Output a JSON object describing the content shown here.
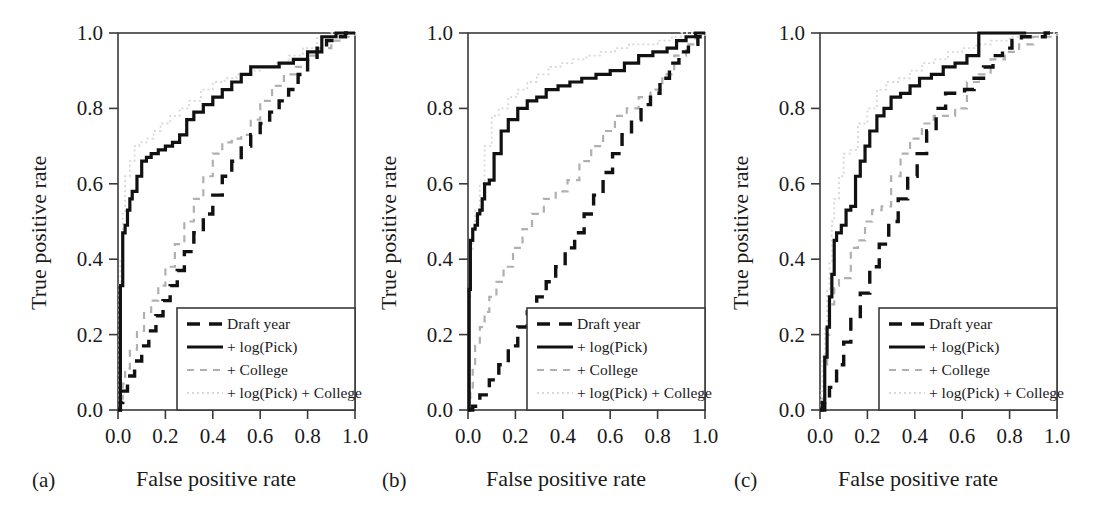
{
  "figure": {
    "background": "#ffffff",
    "panel_count": 3
  },
  "axis": {
    "xlabel": "False positive rate",
    "ylabel": "True positive rate",
    "xticks": [
      "0.0",
      "0.2",
      "0.4",
      "0.6",
      "0.8",
      "1.0"
    ],
    "yticks": [
      "0.0",
      "0.2",
      "0.4",
      "0.6",
      "0.8",
      "1.0"
    ],
    "xlim": [
      0,
      1
    ],
    "ylim": [
      0,
      1
    ]
  },
  "legend": {
    "entries": [
      {
        "label": "Draft year",
        "style": "dashed",
        "color": "#111111",
        "width": 3.4
      },
      {
        "label": "+ log(Pick)",
        "style": "solid",
        "color": "#111111",
        "width": 3.2
      },
      {
        "label": "+ College",
        "style": "dashed",
        "color": "#b0b0b0",
        "width": 2.2
      },
      {
        "label": "+ log(Pick) + College",
        "style": "dotted",
        "color": "#d8d8d8",
        "width": 1.8
      }
    ]
  },
  "panels": [
    {
      "tag": "(a)",
      "name": "panel-a"
    },
    {
      "tag": "(b)",
      "name": "panel-b"
    },
    {
      "tag": "(c)",
      "name": "panel-c"
    }
  ],
  "chart_data": {
    "type": "line",
    "title": "",
    "xlabel": "False positive rate",
    "ylabel": "True positive rate",
    "xlim": [
      0,
      1
    ],
    "ylim": [
      0,
      1
    ],
    "grid": false,
    "legend_position": "lower-right",
    "panels": [
      {
        "tag": "(a)",
        "series": [
          {
            "name": "Draft year",
            "x": [
              0.0,
              0.01,
              0.02,
              0.04,
              0.07,
              0.1,
              0.13,
              0.16,
              0.19,
              0.22,
              0.25,
              0.28,
              0.32,
              0.36,
              0.4,
              0.44,
              0.48,
              0.52,
              0.56,
              0.6,
              0.64,
              0.68,
              0.72,
              0.76,
              0.8,
              0.84,
              0.88,
              0.92,
              0.96,
              1.0
            ],
            "y": [
              0.0,
              0.02,
              0.05,
              0.09,
              0.13,
              0.17,
              0.21,
              0.25,
              0.29,
              0.33,
              0.37,
              0.42,
              0.47,
              0.52,
              0.57,
              0.62,
              0.66,
              0.7,
              0.73,
              0.76,
              0.79,
              0.82,
              0.85,
              0.89,
              0.93,
              0.96,
              0.98,
              0.99,
              1.0,
              1.0
            ]
          },
          {
            "name": "+ log(Pick)",
            "x": [
              0.0,
              0.01,
              0.02,
              0.03,
              0.04,
              0.05,
              0.06,
              0.08,
              0.1,
              0.12,
              0.14,
              0.17,
              0.2,
              0.23,
              0.26,
              0.29,
              0.32,
              0.36,
              0.4,
              0.44,
              0.48,
              0.52,
              0.56,
              0.62,
              0.68,
              0.74,
              0.8,
              0.86,
              0.92,
              1.0
            ],
            "y": [
              0.0,
              0.33,
              0.47,
              0.49,
              0.53,
              0.56,
              0.58,
              0.62,
              0.66,
              0.67,
              0.68,
              0.69,
              0.7,
              0.71,
              0.73,
              0.77,
              0.79,
              0.81,
              0.83,
              0.85,
              0.87,
              0.89,
              0.91,
              0.91,
              0.92,
              0.93,
              0.95,
              0.99,
              1.0,
              1.0
            ]
          },
          {
            "name": "+ College",
            "x": [
              0.0,
              0.01,
              0.02,
              0.03,
              0.05,
              0.08,
              0.11,
              0.14,
              0.17,
              0.2,
              0.24,
              0.28,
              0.32,
              0.36,
              0.4,
              0.44,
              0.48,
              0.52,
              0.56,
              0.6,
              0.65,
              0.7,
              0.75,
              0.8,
              0.85,
              0.9,
              0.95,
              1.0
            ],
            "y": [
              0.0,
              0.03,
              0.07,
              0.11,
              0.16,
              0.21,
              0.26,
              0.29,
              0.33,
              0.38,
              0.44,
              0.5,
              0.56,
              0.62,
              0.68,
              0.71,
              0.72,
              0.73,
              0.77,
              0.82,
              0.86,
              0.89,
              0.91,
              0.94,
              0.96,
              0.98,
              0.99,
              1.0
            ]
          },
          {
            "name": "+ log(Pick) + College",
            "x": [
              0.0,
              0.005,
              0.01,
              0.02,
              0.03,
              0.05,
              0.07,
              0.09,
              0.12,
              0.15,
              0.18,
              0.22,
              0.26,
              0.3,
              0.35,
              0.4,
              0.45,
              0.5,
              0.55,
              0.6,
              0.66,
              0.72,
              0.78,
              0.84,
              0.9,
              0.96,
              1.0
            ],
            "y": [
              0.0,
              0.34,
              0.4,
              0.52,
              0.62,
              0.66,
              0.7,
              0.71,
              0.72,
              0.74,
              0.76,
              0.78,
              0.8,
              0.82,
              0.85,
              0.87,
              0.88,
              0.89,
              0.9,
              0.91,
              0.92,
              0.94,
              0.96,
              0.99,
              1.0,
              1.0,
              1.0
            ]
          }
        ]
      },
      {
        "tag": "(b)",
        "series": [
          {
            "name": "Draft year",
            "x": [
              0.0,
              0.02,
              0.05,
              0.09,
              0.13,
              0.17,
              0.21,
              0.25,
              0.29,
              0.33,
              0.37,
              0.41,
              0.45,
              0.49,
              0.53,
              0.57,
              0.61,
              0.65,
              0.69,
              0.73,
              0.77,
              0.81,
              0.85,
              0.89,
              0.93,
              0.97,
              1.0
            ],
            "y": [
              0.0,
              0.01,
              0.04,
              0.08,
              0.12,
              0.17,
              0.22,
              0.26,
              0.3,
              0.34,
              0.38,
              0.43,
              0.47,
              0.52,
              0.57,
              0.63,
              0.68,
              0.73,
              0.77,
              0.81,
              0.84,
              0.88,
              0.92,
              0.95,
              0.97,
              0.99,
              1.0
            ]
          },
          {
            "name": "+ log(Pick)",
            "x": [
              0.0,
              0.005,
              0.01,
              0.02,
              0.03,
              0.04,
              0.05,
              0.06,
              0.07,
              0.09,
              0.11,
              0.14,
              0.17,
              0.21,
              0.25,
              0.29,
              0.33,
              0.38,
              0.43,
              0.48,
              0.54,
              0.6,
              0.66,
              0.72,
              0.78,
              0.84,
              0.88,
              0.92,
              0.96,
              1.0
            ],
            "y": [
              0.0,
              0.32,
              0.45,
              0.48,
              0.49,
              0.52,
              0.53,
              0.56,
              0.6,
              0.61,
              0.68,
              0.74,
              0.77,
              0.8,
              0.82,
              0.83,
              0.85,
              0.86,
              0.87,
              0.88,
              0.89,
              0.9,
              0.92,
              0.94,
              0.95,
              0.96,
              0.98,
              0.99,
              1.0,
              1.0
            ]
          },
          {
            "name": "+ College",
            "x": [
              0.0,
              0.01,
              0.02,
              0.03,
              0.05,
              0.07,
              0.09,
              0.12,
              0.15,
              0.19,
              0.23,
              0.27,
              0.32,
              0.37,
              0.42,
              0.47,
              0.52,
              0.57,
              0.62,
              0.67,
              0.72,
              0.77,
              0.82,
              0.87,
              0.92,
              0.96,
              1.0
            ],
            "y": [
              0.0,
              0.05,
              0.11,
              0.17,
              0.22,
              0.26,
              0.3,
              0.34,
              0.38,
              0.43,
              0.48,
              0.52,
              0.56,
              0.58,
              0.61,
              0.66,
              0.7,
              0.74,
              0.78,
              0.8,
              0.83,
              0.85,
              0.89,
              0.94,
              0.97,
              0.99,
              1.0
            ]
          },
          {
            "name": "+ log(Pick) + College",
            "x": [
              0.0,
              0.005,
              0.01,
              0.02,
              0.03,
              0.05,
              0.07,
              0.1,
              0.13,
              0.17,
              0.21,
              0.25,
              0.29,
              0.34,
              0.39,
              0.44,
              0.5,
              0.56,
              0.62,
              0.68,
              0.74,
              0.8,
              0.86,
              0.9,
              0.94,
              1.0
            ],
            "y": [
              0.0,
              0.3,
              0.42,
              0.48,
              0.53,
              0.6,
              0.7,
              0.78,
              0.8,
              0.83,
              0.85,
              0.87,
              0.89,
              0.91,
              0.92,
              0.93,
              0.94,
              0.95,
              0.96,
              0.97,
              0.97,
              0.98,
              0.99,
              1.0,
              1.0,
              1.0
            ]
          }
        ]
      },
      {
        "tag": "(c)",
        "series": [
          {
            "name": "Draft year",
            "x": [
              0.0,
              0.02,
              0.04,
              0.07,
              0.1,
              0.13,
              0.17,
              0.21,
              0.25,
              0.29,
              0.33,
              0.37,
              0.41,
              0.45,
              0.49,
              0.53,
              0.57,
              0.61,
              0.65,
              0.69,
              0.73,
              0.77,
              0.81,
              0.85,
              0.9,
              0.95,
              1.0
            ],
            "y": [
              0.0,
              0.02,
              0.06,
              0.12,
              0.18,
              0.24,
              0.31,
              0.38,
              0.44,
              0.5,
              0.56,
              0.62,
              0.68,
              0.74,
              0.8,
              0.84,
              0.84,
              0.85,
              0.88,
              0.91,
              0.94,
              0.96,
              0.98,
              0.99,
              0.99,
              1.0,
              1.0
            ]
          },
          {
            "name": "+ log(Pick)",
            "x": [
              0.0,
              0.01,
              0.02,
              0.03,
              0.04,
              0.05,
              0.06,
              0.07,
              0.09,
              0.11,
              0.13,
              0.15,
              0.17,
              0.19,
              0.21,
              0.24,
              0.27,
              0.3,
              0.34,
              0.38,
              0.42,
              0.47,
              0.52,
              0.57,
              0.62,
              0.67,
              0.7,
              0.75,
              0.82,
              0.87
            ],
            "y": [
              0.0,
              0.02,
              0.14,
              0.22,
              0.3,
              0.36,
              0.45,
              0.47,
              0.49,
              0.53,
              0.54,
              0.62,
              0.66,
              0.7,
              0.74,
              0.78,
              0.8,
              0.83,
              0.84,
              0.86,
              0.88,
              0.89,
              0.91,
              0.92,
              0.94,
              1.0,
              1.0,
              1.0,
              1.0,
              1.0
            ]
          },
          {
            "name": "+ College",
            "x": [
              0.0,
              0.01,
              0.02,
              0.03,
              0.04,
              0.06,
              0.08,
              0.1,
              0.13,
              0.16,
              0.19,
              0.22,
              0.26,
              0.3,
              0.34,
              0.38,
              0.43,
              0.48,
              0.53,
              0.57,
              0.62,
              0.67,
              0.72,
              0.78,
              0.84,
              0.9,
              1.0
            ],
            "y": [
              0.0,
              0.03,
              0.12,
              0.2,
              0.28,
              0.33,
              0.35,
              0.35,
              0.43,
              0.45,
              0.5,
              0.53,
              0.54,
              0.62,
              0.68,
              0.72,
              0.76,
              0.78,
              0.78,
              0.8,
              0.87,
              0.89,
              0.93,
              0.95,
              0.97,
              0.99,
              1.0
            ]
          },
          {
            "name": "+ log(Pick) + College",
            "x": [
              0.0,
              0.005,
              0.01,
              0.02,
              0.03,
              0.04,
              0.05,
              0.06,
              0.08,
              0.1,
              0.13,
              0.16,
              0.2,
              0.24,
              0.28,
              0.33,
              0.38,
              0.43,
              0.48,
              0.54,
              0.6,
              0.66,
              0.72,
              0.8,
              0.88,
              0.95,
              1.0
            ],
            "y": [
              0.0,
              0.05,
              0.14,
              0.22,
              0.32,
              0.39,
              0.5,
              0.56,
              0.62,
              0.68,
              0.69,
              0.76,
              0.8,
              0.85,
              0.87,
              0.88,
              0.9,
              0.92,
              0.93,
              0.95,
              0.96,
              0.97,
              0.98,
              0.99,
              0.99,
              1.0,
              1.0
            ]
          }
        ]
      }
    ]
  }
}
